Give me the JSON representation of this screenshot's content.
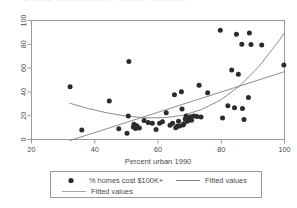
{
  "figure": {
    "background": "#ffffff",
    "axis_color": "#8c8c8c",
    "text_color": "#4a4a4a",
    "marker_color": "#2b2b2b",
    "line_color": "#6e6e6e",
    "clipped_top_text": "% homes cost $100K+ by percent urban"
  },
  "chart_data": {
    "type": "scatter",
    "title": "",
    "subtitle": "",
    "xlabel": "Percent urban 1990",
    "ylabel": "",
    "xlim": [
      20,
      100
    ],
    "ylim": [
      0,
      100
    ],
    "xticks": [
      20,
      40,
      60,
      80,
      100
    ],
    "yticks": [
      0,
      20,
      40,
      60,
      80,
      100
    ],
    "xtick_labels": [
      "20",
      "40",
      "60",
      "80",
      "100"
    ],
    "ytick_labels": [
      "0",
      "20",
      "40",
      "60",
      "80",
      "100"
    ],
    "ytick_label_rotation": -90,
    "grid": false,
    "legend_position": "below-axes",
    "series": [
      {
        "name": "% homes cost $100K+",
        "type": "scatter",
        "marker": "filled-circle",
        "color": "#2b2b2b",
        "points": [
          [
            32.2,
            44.4
          ],
          [
            35.9,
            7.9
          ],
          [
            44.6,
            32.3
          ],
          [
            47.6,
            9.0
          ],
          [
            50.2,
            5.3
          ],
          [
            50.6,
            19.8
          ],
          [
            50.8,
            65.6
          ],
          [
            52.2,
            10.6
          ],
          [
            52.4,
            12.8
          ],
          [
            52.9,
            9.3
          ],
          [
            53.3,
            11.6
          ],
          [
            54.1,
            9.6
          ],
          [
            55.6,
            15.9
          ],
          [
            56.9,
            14.2
          ],
          [
            58.2,
            13.7
          ],
          [
            59.4,
            8.3
          ],
          [
            60.5,
            13.6
          ],
          [
            61.4,
            15.0
          ],
          [
            62.6,
            22.5
          ],
          [
            63.8,
            11.9
          ],
          [
            64.6,
            13.6
          ],
          [
            65.2,
            37.6
          ],
          [
            65.6,
            9.8
          ],
          [
            66.1,
            11.1
          ],
          [
            66.5,
            15.4
          ],
          [
            66.8,
            11.3
          ],
          [
            67.4,
            40.1
          ],
          [
            67.6,
            25.6
          ],
          [
            67.9,
            12.1
          ],
          [
            68.2,
            13.2
          ],
          [
            68.6,
            17.2
          ],
          [
            68.9,
            19.7
          ],
          [
            69.3,
            15.4
          ],
          [
            69.8,
            18.0
          ],
          [
            70.3,
            19.1
          ],
          [
            70.6,
            16.1
          ],
          [
            71.4,
            19.8
          ],
          [
            72.3,
            19.4
          ],
          [
            73.0,
            45.5
          ],
          [
            73.6,
            18.9
          ],
          [
            75.7,
            39.3
          ],
          [
            79.7,
            91.9
          ],
          [
            80.4,
            18.1
          ],
          [
            82.1,
            28.3
          ],
          [
            83.3,
            58.5
          ],
          [
            84.2,
            26.6
          ],
          [
            84.8,
            88.4
          ],
          [
            85.4,
            54.9
          ],
          [
            86.5,
            80.0
          ],
          [
            86.7,
            26.1
          ],
          [
            87.2,
            16.8
          ],
          [
            88.6,
            35.3
          ],
          [
            88.9,
            89.6
          ],
          [
            89.4,
            79.9
          ],
          [
            92.8,
            79.5
          ],
          [
            99.8,
            62.6
          ]
        ]
      },
      {
        "name": "Fitted values",
        "type": "line",
        "fit": "linear",
        "color": "#6e6e6e",
        "points": [
          [
            32.0,
            -1.0
          ],
          [
            100.0,
            57.0
          ]
        ]
      },
      {
        "name": "Fitted values",
        "type": "line",
        "fit": "quadratic",
        "color": "#6e6e6e",
        "points": [
          [
            32.0,
            30.5
          ],
          [
            38.0,
            26.0
          ],
          [
            44.0,
            22.3
          ],
          [
            50.0,
            19.7
          ],
          [
            56.0,
            18.2
          ],
          [
            62.0,
            18.3
          ],
          [
            68.0,
            20.4
          ],
          [
            74.0,
            25.4
          ],
          [
            80.0,
            33.5
          ],
          [
            86.0,
            45.4
          ],
          [
            92.0,
            61.7
          ],
          [
            98.0,
            82.1
          ],
          [
            100.0,
            89.6
          ]
        ]
      }
    ]
  },
  "legend": {
    "entries": [
      {
        "label": "% homes cost $100K+",
        "glyph": "filled-circle-marker"
      },
      {
        "label": "Fitted values",
        "glyph": "line-swatch"
      },
      {
        "label": "Fitted values",
        "glyph": "line-swatch"
      }
    ]
  }
}
